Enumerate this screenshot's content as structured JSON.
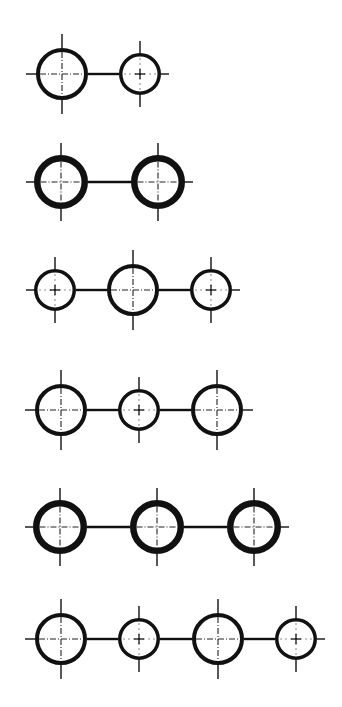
{
  "colors": {
    "background": "#ffffff",
    "stroke": "#111111"
  },
  "circle_types": {
    "L": {
      "name": "large",
      "r": 26,
      "stroke_width": 4,
      "center_style": "dash-dot",
      "tick": 14
    },
    "S": {
      "name": "small",
      "r": 21,
      "stroke_width": 3.5,
      "center_style": "dotted-plus",
      "tick": 12
    },
    "T": {
      "name": "thick",
      "r": 27,
      "stroke_width": 6.5,
      "center_style": "dash-dot",
      "tick": 12
    }
  },
  "rows": [
    {
      "id": "row-1",
      "y": 74,
      "circles": [
        {
          "type": "L",
          "x": 62
        },
        {
          "type": "S",
          "x": 140
        }
      ]
    },
    {
      "id": "row-2",
      "y": 182,
      "circles": [
        {
          "type": "T",
          "x": 61
        },
        {
          "type": "T",
          "x": 158
        }
      ]
    },
    {
      "id": "row-3",
      "y": 290,
      "circles": [
        {
          "type": "S",
          "x": 55
        },
        {
          "type": "L",
          "x": 133
        },
        {
          "type": "S",
          "x": 211
        }
      ]
    },
    {
      "id": "row-4",
      "y": 410,
      "circles": [
        {
          "type": "L",
          "x": 61
        },
        {
          "type": "S",
          "x": 139
        },
        {
          "type": "L",
          "x": 217
        }
      ]
    },
    {
      "id": "row-5",
      "y": 527,
      "circles": [
        {
          "type": "T",
          "x": 60
        },
        {
          "type": "T",
          "x": 157
        },
        {
          "type": "T",
          "x": 254
        }
      ]
    },
    {
      "id": "row-6",
      "y": 639,
      "circles": [
        {
          "type": "L",
          "x": 61
        },
        {
          "type": "S",
          "x": 139
        },
        {
          "type": "L",
          "x": 218
        },
        {
          "type": "S",
          "x": 296
        }
      ]
    }
  ]
}
